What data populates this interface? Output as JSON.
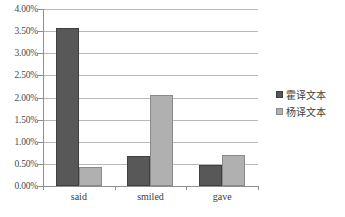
{
  "chart_data": {
    "type": "bar",
    "title": "",
    "subtitle": "",
    "xlabel": "",
    "ylabel": "",
    "categories": [
      "said",
      "smiled",
      "gave"
    ],
    "series": [
      {
        "name": "霍译文本",
        "color": "#585858",
        "values": [
          3.58,
          0.67,
          0.48
        ]
      },
      {
        "name": "杨译文本",
        "color": "#b0b0b0",
        "values": [
          0.43,
          2.06,
          0.7
        ]
      }
    ],
    "ylim": [
      0,
      4.0
    ],
    "ytick_step": 0.5,
    "ytick_labels": [
      "0.00%",
      "0.50%",
      "1.00%",
      "1.50%",
      "2.00%",
      "2.50%",
      "3.00%",
      "3.50%",
      "4.00%"
    ],
    "ytick_values": [
      0,
      0.5,
      1.0,
      1.5,
      2.0,
      2.5,
      3.0,
      3.5,
      4.0
    ],
    "value_format": "percent",
    "grid": {
      "horizontal": true,
      "vertical": false
    },
    "legend": {
      "position": "right",
      "entries": [
        "霍译文本",
        "杨译文本"
      ]
    },
    "axis_colors": {
      "grid": "#b8b8b8",
      "axis": "#8f8f8f",
      "text": "#3d3d3d"
    }
  }
}
